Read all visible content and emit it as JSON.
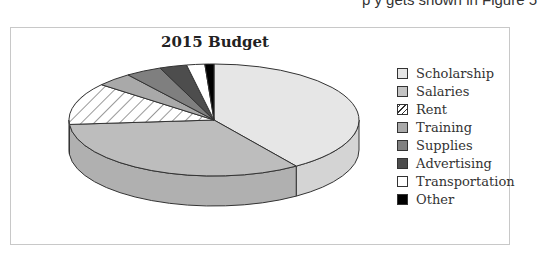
{
  "page": {
    "top_text": "p  y                    gets shown in Figure 5"
  },
  "chart_data": {
    "type": "pie",
    "style": "3d-pie",
    "title": "2015 Budget",
    "legend_position": "right",
    "categories": [
      "Scholarship",
      "Salaries",
      "Rent",
      "Training",
      "Supplies",
      "Advertising",
      "Transportation",
      "Other"
    ],
    "values": [
      40,
      33,
      12,
      4,
      4,
      3,
      2,
      1
    ],
    "unit": "percent (estimated from slice angles)",
    "colors": [
      "#e6e6e6",
      "#bdbdbd",
      "hatch",
      "#a9a9a9",
      "#7f7f7f",
      "#4d4d4d",
      "#ffffff",
      "#000000"
    ]
  },
  "legend": {
    "items": [
      {
        "label": "Scholarship",
        "color": "#e6e6e6"
      },
      {
        "label": "Salaries",
        "color": "#c4c4c4"
      },
      {
        "label": "Rent",
        "color": "hatch"
      },
      {
        "label": "Training",
        "color": "#a9a9a9"
      },
      {
        "label": "Supplies",
        "color": "#808080"
      },
      {
        "label": "Advertising",
        "color": "#4d4d4d"
      },
      {
        "label": "Transportation",
        "color": "#ffffff"
      },
      {
        "label": "Other",
        "color": "#000000"
      }
    ]
  }
}
